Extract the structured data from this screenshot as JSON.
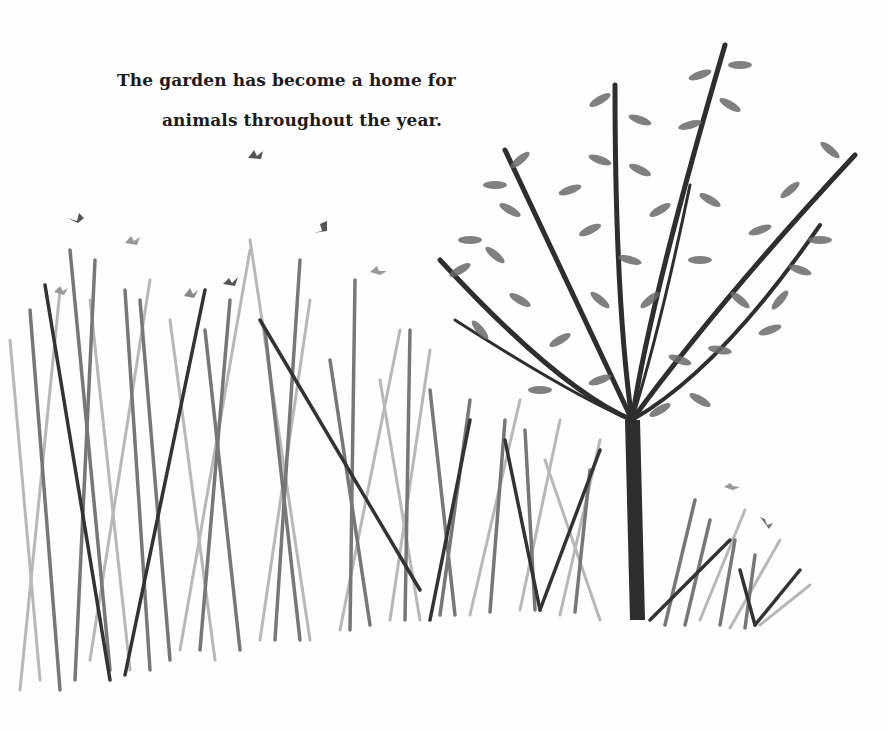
{
  "page": {
    "caption": {
      "line1": "The garden has become a home for",
      "line2": "animals throughout the year."
    },
    "illustration": {
      "subject": "tall grass meadow with butterflies and a leafy young tree",
      "colors": {
        "background": "#fefefe",
        "dark": "#2e2e2e",
        "mid": "#6a6a6a",
        "light": "#a8a8a8",
        "pale": "#cfcfcf"
      },
      "butterflies": [
        {
          "x": 256,
          "y": 155
        },
        {
          "x": 75,
          "y": 215
        },
        {
          "x": 133,
          "y": 240
        },
        {
          "x": 320,
          "y": 228
        },
        {
          "x": 230,
          "y": 280
        },
        {
          "x": 188,
          "y": 292
        },
        {
          "x": 378,
          "y": 270
        },
        {
          "x": 60,
          "y": 288
        },
        {
          "x": 731,
          "y": 486
        },
        {
          "x": 765,
          "y": 520
        }
      ]
    }
  }
}
